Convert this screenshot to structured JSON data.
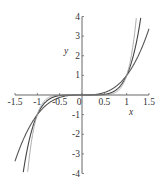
{
  "chart_data": {
    "type": "line",
    "title": "",
    "xlabel": "x",
    "ylabel": "y",
    "xlim": [
      -1.5,
      1.5
    ],
    "ylim": [
      -4,
      4
    ],
    "grid": false,
    "legend": null,
    "x_ticks": [
      "-1.5",
      "-1",
      "-0.5",
      "0",
      "0.5",
      "1",
      "1.5"
    ],
    "y_ticks": [
      "-4",
      "-3",
      "-2",
      "-1",
      "1",
      "2",
      "3",
      "4"
    ],
    "series": [
      {
        "name": "x^3",
        "exponent": 3,
        "color": "#555555",
        "width": 1.1
      },
      {
        "name": "x^5",
        "exponent": 5,
        "color": "#444444",
        "width": 1.1
      },
      {
        "name": "x^7",
        "exponent": 7,
        "color": "#aaaaaa",
        "width": 1.0
      }
    ],
    "annotations": []
  },
  "axes": {
    "x_label": "x",
    "y_label": "y",
    "x_tick_values": [
      -1.5,
      -1,
      -0.5,
      0,
      0.5,
      1,
      1.5
    ],
    "x_tick_labels": [
      "-1.5",
      "-1",
      "-0.5",
      "0",
      "0.5",
      "1",
      "1.5"
    ],
    "y_tick_values": [
      -4,
      -3,
      -2,
      -1,
      1,
      2,
      3,
      4
    ],
    "y_tick_labels": [
      "-4",
      "-3",
      "-2",
      "-1",
      "1",
      "2",
      "3",
      "4"
    ]
  },
  "colors": {
    "axis": "#666666",
    "text": "#333333"
  }
}
